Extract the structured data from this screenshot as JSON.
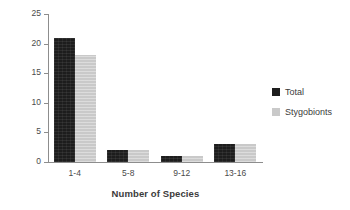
{
  "chart_data": {
    "type": "bar",
    "title": "",
    "xlabel": "Number of Species",
    "ylabel": "Number of Drips",
    "categories": [
      "1-4",
      "5-8",
      "9-12",
      "13-16"
    ],
    "series": [
      {
        "name": "Total",
        "color": "#1d1d1d",
        "values": [
          21,
          2,
          1,
          3
        ]
      },
      {
        "name": "Stygobionts",
        "color": "#c9c9c9",
        "values": [
          18,
          2,
          1,
          3
        ]
      }
    ],
    "ylim": [
      0,
      25
    ],
    "yticks": [
      0,
      5,
      10,
      15,
      20,
      25
    ],
    "ytick_labels": [
      "0",
      "5",
      "10",
      "15",
      "20",
      "25"
    ],
    "grid": false,
    "legend_position": "right"
  },
  "legend": {
    "entries": [
      {
        "label": "Total"
      },
      {
        "label": "Stygobionts"
      }
    ]
  }
}
